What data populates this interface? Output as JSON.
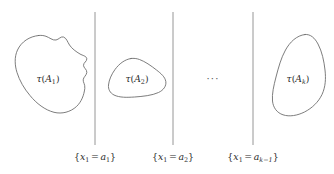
{
  "figure": {
    "type": "mathematical-diagram",
    "background_color": "#ffffff",
    "curve_color": "#6e6e6e",
    "line_color": "#8a8a8a",
    "text_color": "#2b2b2b",
    "width": 334,
    "height": 174
  },
  "regions": [
    {
      "id": "region-1",
      "label_tau": "τ",
      "label_open": "(",
      "label_base": "A",
      "label_subscript": "1",
      "label_close": ")",
      "label_full": "τ(A₁)",
      "label_x": 48,
      "label_y": 82,
      "path": "M 38.5 35.5 C 29.5 36.5 21.5 41.5 17.5 50.0 C 14.2 57.0 14.8 65.5 17.0 72.5 C 19.5 80.5 24.0 88.5 30.0 95.5 C 36.5 103.5 45.0 110.0 54.0 112.3 C 62.0 114.3 70.5 112.0 76.5 106.5 C 81.5 101.8 84.0 95.0 84.8 88.5 C 85.3 84.3 83.0 82.5 83.2 79.8 C 83.4 77.0 86.5 75.5 86.8 72.5 C 87.1 69.3 83.5 68.0 83.5 65.3 C 83.5 62.5 87.0 61.5 86.8 58.8 C 86.6 56.0 82.5 55.5 80.0 54.0 C 76.0 51.6 72.0 48.8 69.5 45.0 C 67.5 42.0 66.5 38.0 63.5 37.0 C 60.8 36.1 58.8 39.5 56.0 40.0 C 52.5 40.6 49.5 37.5 46.0 36.3 C 43.5 35.4 41.0 35.2 38.5 35.5 Z"
    },
    {
      "id": "region-2",
      "label_tau": "τ",
      "label_open": "(",
      "label_base": "A",
      "label_subscript": "2",
      "label_close": ")",
      "label_full": "τ(A₂)",
      "label_x": 137,
      "label_y": 82,
      "path": "M 131.0 58.5 C 124.5 59.5 119.0 64.0 115.0 69.5 C 111.5 74.3 109.0 79.8 108.5 85.0 C 108.1 89.2 110.0 93.0 114.0 95.0 C 119.5 97.7 127.0 97.5 134.5 97.0 C 143.0 96.4 152.0 95.5 158.5 92.5 C 163.5 90.2 166.5 86.0 165.8 81.5 C 165.1 77.0 161.0 73.5 156.5 70.0 C 151.0 65.7 145.0 61.5 139.5 59.5 C 136.7 58.5 133.8 58.1 131.0 58.5 Z"
    },
    {
      "id": "region-k",
      "label_tau": "τ",
      "label_open": "(",
      "label_base": "A",
      "label_subscript": "k",
      "label_close": ")",
      "label_full": "τ(Aₖ)",
      "label_x": 298,
      "label_y": 82,
      "path": "M 305.0 34.5 C 296.5 35.5 290.0 42.0 285.5 50.0 C 281.0 58.0 278.5 67.5 276.0 77.0 C 273.8 85.5 271.8 94.0 272.5 101.0 C 273.2 107.8 277.0 112.8 283.0 114.8 C 289.5 117.0 297.5 115.5 304.5 112.0 C 312.0 108.2 318.5 102.0 322.0 94.5 C 325.5 87.0 326.0 78.5 325.0 70.0 C 324.0 61.0 322.0 51.5 318.0 44.0 C 314.8 38.0 310.5 33.9 305.0 34.5 Z"
    }
  ],
  "hyperplanes": [
    {
      "id": "hyperplane-1",
      "x": 95,
      "y_top": 12,
      "y_bottom": 145,
      "label_prefix": "{",
      "label_var": "x",
      "label_var_sub": "1",
      "label_eq": "=",
      "label_val": "a",
      "label_val_sub": "1",
      "label_suffix": "}",
      "label_full": "{x₁ = a₁}",
      "label_x": 95,
      "label_y": 160
    },
    {
      "id": "hyperplane-2",
      "x": 173,
      "y_top": 12,
      "y_bottom": 145,
      "label_prefix": "{",
      "label_var": "x",
      "label_var_sub": "1",
      "label_eq": "=",
      "label_val": "a",
      "label_val_sub": "2",
      "label_suffix": "}",
      "label_full": "{x₁ = a₂}",
      "label_x": 173,
      "label_y": 160
    },
    {
      "id": "hyperplane-k-1",
      "x": 253,
      "y_top": 12,
      "y_bottom": 145,
      "label_prefix": "{",
      "label_var": "x",
      "label_var_sub": "1",
      "label_eq": "=",
      "label_val": "a",
      "label_val_sub": "k−1",
      "label_suffix": "}",
      "label_full": "{x₁ = aₖ₋₁}",
      "label_x": 253,
      "label_y": 160
    }
  ],
  "ellipsis": {
    "text": "···",
    "x": 213,
    "y": 82
  }
}
